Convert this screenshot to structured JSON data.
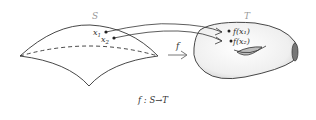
{
  "diagram": {
    "source_set_label": "S",
    "target_set_label": "T",
    "map_label": "f",
    "caption": "f : S→T",
    "points": [
      {
        "name": "x1",
        "label_base": "x",
        "label_sub": "1",
        "image_label": "f(x₁)"
      },
      {
        "name": "x2",
        "label_base": "x",
        "label_sub": "2",
        "image_label": "f(x₂)"
      }
    ],
    "colors": {
      "stroke": "#333333",
      "label": "#333333",
      "set_label": "#999999",
      "surface_fill": "#f2f2f2",
      "hole_fill": "#bdbdbd"
    }
  }
}
